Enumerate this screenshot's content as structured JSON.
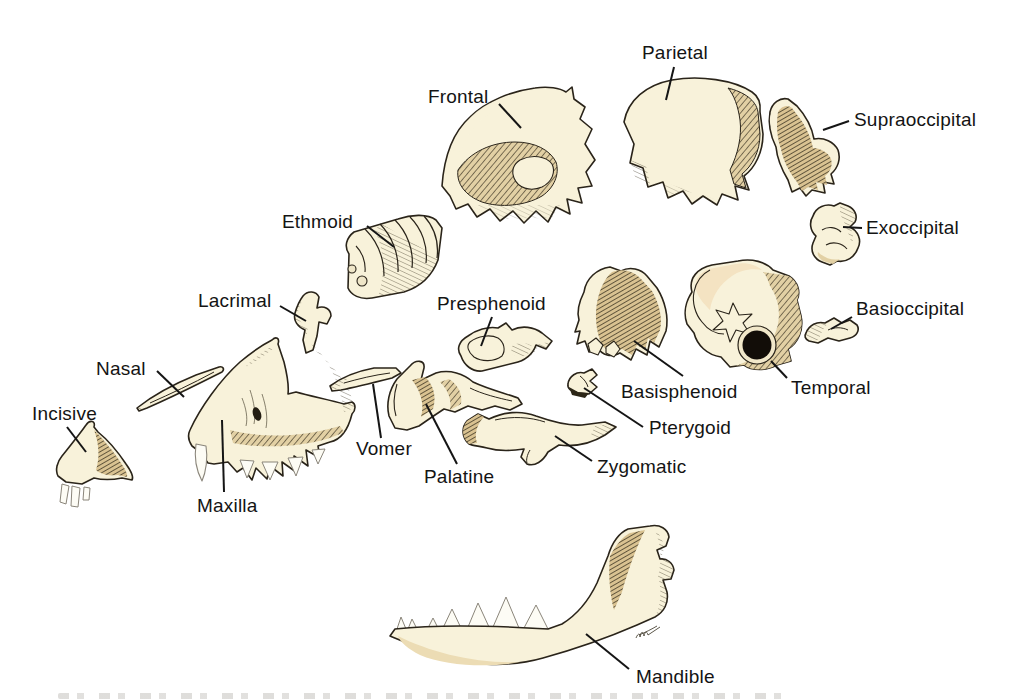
{
  "figure": {
    "background_color": "#ffffff",
    "label_color": "#141414",
    "leader_line_color": "#151515",
    "bone_fill_color": "#f8f2da",
    "bone_shade_color": "#e2d0a4",
    "bone_outline_color": "#2a241a",
    "labels": [
      {
        "id": "frontal",
        "text": "Frontal"
      },
      {
        "id": "parietal",
        "text": "Parietal"
      },
      {
        "id": "supraoccipital",
        "text": "Supraoccipital"
      },
      {
        "id": "exoccipital",
        "text": "Exoccipital"
      },
      {
        "id": "ethmoid",
        "text": "Ethmoid"
      },
      {
        "id": "presphenoid",
        "text": "Presphenoid"
      },
      {
        "id": "basioccipital",
        "text": "Basioccipital"
      },
      {
        "id": "lacrimal",
        "text": "Lacrimal"
      },
      {
        "id": "basisphenoid",
        "text": "Basisphenoid"
      },
      {
        "id": "temporal",
        "text": "Temporal"
      },
      {
        "id": "nasal",
        "text": "Nasal"
      },
      {
        "id": "pterygoid",
        "text": "Pterygoid"
      },
      {
        "id": "incisive",
        "text": "Incisive"
      },
      {
        "id": "vomer",
        "text": "Vomer"
      },
      {
        "id": "palatine",
        "text": "Palatine"
      },
      {
        "id": "zygomatic",
        "text": "Zygomatic"
      },
      {
        "id": "maxilla",
        "text": "Maxilla"
      },
      {
        "id": "mandible",
        "text": "Mandible"
      }
    ]
  }
}
